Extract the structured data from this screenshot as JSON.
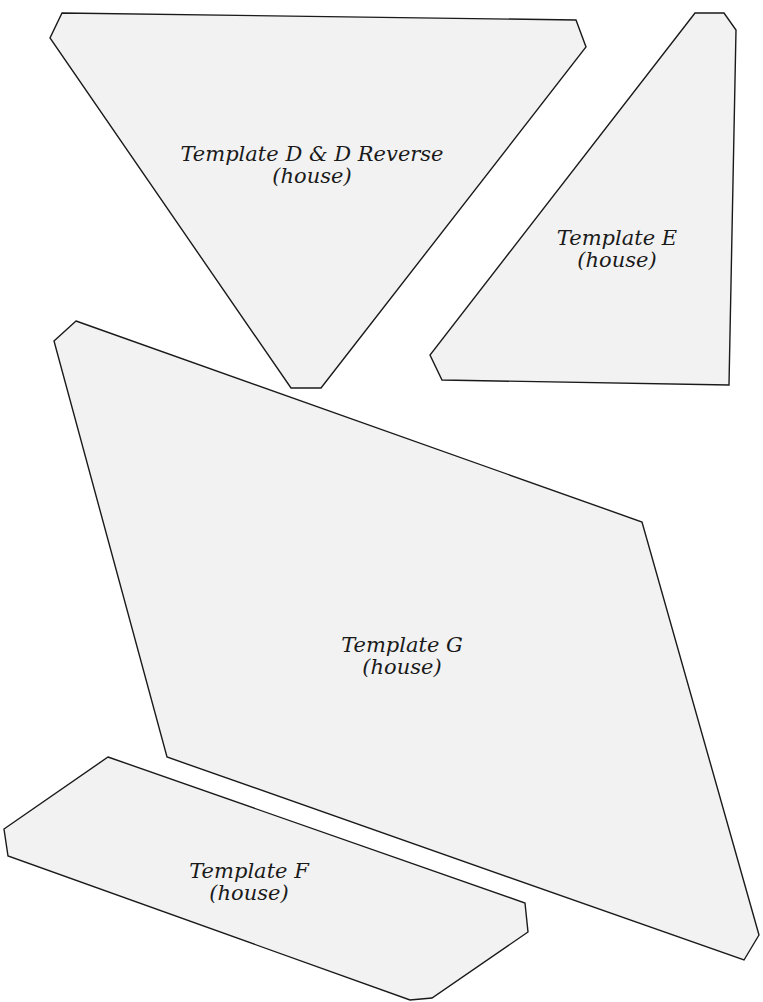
{
  "page": {
    "background": "#ffffff",
    "shape_fill": "#f2f2f2",
    "shape_stroke": "#1a1a1a"
  },
  "templates": [
    {
      "id": "D",
      "title": "Template D & D Reverse",
      "subtitle": "(house)",
      "points": "62,13 576,20 586,47 321,388 291,388 50,38"
    },
    {
      "id": "E",
      "title": "Template E",
      "subtitle": "(house)",
      "points": "695,13 724,13 736,30 729,385 442,380 430,355"
    },
    {
      "id": "G",
      "title": "Template G",
      "subtitle": "(house)",
      "points": "76,321 642,522 759,935 744,960 167,757 54,341"
    },
    {
      "id": "F",
      "title": "Template F",
      "subtitle": "(house)",
      "points": "108,757 525,903 528,932 432,998 410,1000 8,856 4,829"
    }
  ]
}
